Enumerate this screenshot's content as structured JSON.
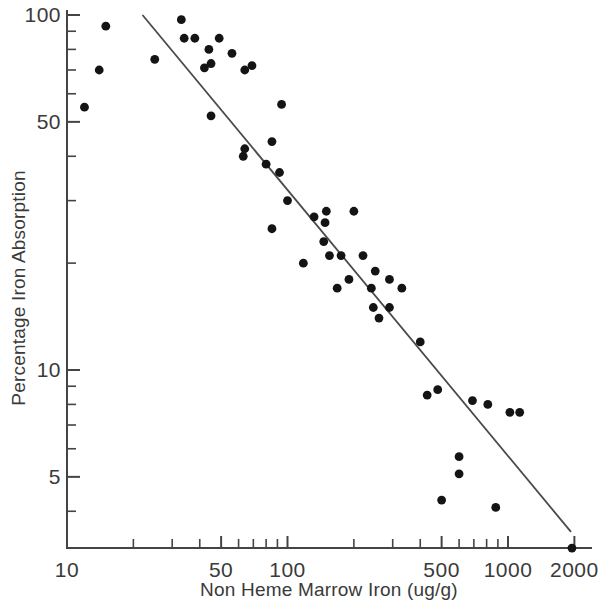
{
  "chart_data": {
    "type": "scatter",
    "title": "",
    "xlabel": "Non Heme Marrow Iron (ug/g)",
    "ylabel": "Percentage Iron Absorption",
    "xscale": "log",
    "yscale": "log",
    "xlim": [
      10,
      2000
    ],
    "ylim": [
      3,
      100
    ],
    "grid": false,
    "legend": null,
    "xticklabels": [
      "10",
      "50",
      "100",
      "500",
      "1000",
      "2000"
    ],
    "xtickvalues": [
      10,
      50,
      100,
      500,
      1000,
      2000
    ],
    "xminorticks": [
      20,
      30,
      40,
      60,
      70,
      80,
      90,
      200,
      300,
      400,
      600,
      700,
      800,
      900
    ],
    "yticklabels": [
      "100",
      "50",
      "10",
      "5"
    ],
    "ytickvalues": [
      100,
      50,
      10,
      5
    ],
    "yminorticks": [
      90,
      80,
      70,
      60,
      40,
      30,
      20,
      9,
      8,
      7,
      6,
      4
    ],
    "points": [
      {
        "x": 12,
        "y": 55
      },
      {
        "x": 15,
        "y": 93
      },
      {
        "x": 14,
        "y": 70
      },
      {
        "x": 25,
        "y": 75
      },
      {
        "x": 33,
        "y": 97
      },
      {
        "x": 34,
        "y": 86
      },
      {
        "x": 38,
        "y": 86
      },
      {
        "x": 42,
        "y": 71
      },
      {
        "x": 44,
        "y": 80
      },
      {
        "x": 45,
        "y": 73
      },
      {
        "x": 45,
        "y": 52
      },
      {
        "x": 49,
        "y": 86
      },
      {
        "x": 56,
        "y": 78
      },
      {
        "x": 64,
        "y": 70
      },
      {
        "x": 69,
        "y": 72
      },
      {
        "x": 64,
        "y": 42
      },
      {
        "x": 94,
        "y": 56
      },
      {
        "x": 85,
        "y": 44
      },
      {
        "x": 63,
        "y": 40
      },
      {
        "x": 80,
        "y": 38
      },
      {
        "x": 92,
        "y": 36
      },
      {
        "x": 100,
        "y": 30
      },
      {
        "x": 150,
        "y": 28
      },
      {
        "x": 132,
        "y": 27
      },
      {
        "x": 148,
        "y": 26
      },
      {
        "x": 200,
        "y": 28
      },
      {
        "x": 85,
        "y": 25
      },
      {
        "x": 146,
        "y": 23
      },
      {
        "x": 118,
        "y": 20
      },
      {
        "x": 155,
        "y": 21
      },
      {
        "x": 175,
        "y": 21
      },
      {
        "x": 220,
        "y": 21
      },
      {
        "x": 250,
        "y": 19
      },
      {
        "x": 168,
        "y": 17
      },
      {
        "x": 190,
        "y": 18
      },
      {
        "x": 240,
        "y": 17
      },
      {
        "x": 290,
        "y": 18
      },
      {
        "x": 330,
        "y": 17
      },
      {
        "x": 245,
        "y": 15
      },
      {
        "x": 260,
        "y": 14
      },
      {
        "x": 290,
        "y": 15
      },
      {
        "x": 400,
        "y": 12
      },
      {
        "x": 430,
        "y": 8.5
      },
      {
        "x": 480,
        "y": 8.8
      },
      {
        "x": 690,
        "y": 8.2
      },
      {
        "x": 810,
        "y": 8.0
      },
      {
        "x": 600,
        "y": 5.7
      },
      {
        "x": 600,
        "y": 5.1
      },
      {
        "x": 500,
        "y": 4.3
      },
      {
        "x": 880,
        "y": 4.1
      },
      {
        "x": 1020,
        "y": 7.6
      },
      {
        "x": 1130,
        "y": 7.6
      },
      {
        "x": 1950,
        "y": 3.15
      }
    ],
    "fit_line": {
      "label": "regression line",
      "x_start": 22,
      "y_start": 100,
      "x_end": 1930,
      "y_end": 3.5
    }
  },
  "axes": {
    "y_title": "Percentage Iron Absorption",
    "x_title": "Non Heme Marrow Iron (ug/g)"
  }
}
